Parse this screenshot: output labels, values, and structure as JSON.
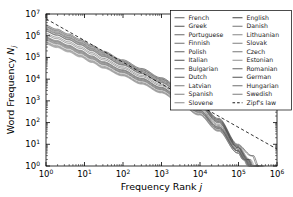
{
  "chart_data": {
    "type": "line",
    "title": "",
    "xlabel": "Frequency Rank j",
    "ylabel": "Word Frequency N_j",
    "xlabel_base": "Frequency Rank ",
    "xlabel_italic": "j",
    "ylabel_base": "Word Frequency ",
    "ylabel_italic": "N",
    "ylabel_sub": "j",
    "xscale": "log",
    "yscale": "log",
    "xlim": [
      1,
      1000000
    ],
    "ylim": [
      1,
      10000000
    ],
    "grid": false,
    "legend_position": "upper right",
    "xticks": [
      {
        "value": 1,
        "mantissa": "10",
        "exponent": "0"
      },
      {
        "value": 10,
        "mantissa": "10",
        "exponent": "1"
      },
      {
        "value": 100,
        "mantissa": "10",
        "exponent": "2"
      },
      {
        "value": 1000,
        "mantissa": "10",
        "exponent": "3"
      },
      {
        "value": 10000,
        "mantissa": "10",
        "exponent": "4"
      },
      {
        "value": 100000,
        "mantissa": "10",
        "exponent": "5"
      },
      {
        "value": 1000000,
        "mantissa": "10",
        "exponent": "6"
      }
    ],
    "yticks": [
      {
        "value": 1,
        "mantissa": "10",
        "exponent": "0"
      },
      {
        "value": 10,
        "mantissa": "10",
        "exponent": "1"
      },
      {
        "value": 100,
        "mantissa": "10",
        "exponent": "2"
      },
      {
        "value": 1000,
        "mantissa": "10",
        "exponent": "3"
      },
      {
        "value": 10000,
        "mantissa": "10",
        "exponent": "4"
      },
      {
        "value": 100000,
        "mantissa": "10",
        "exponent": "5"
      },
      {
        "value": 1000000,
        "mantissa": "10",
        "exponent": "6"
      },
      {
        "value": 10000000,
        "mantissa": "10",
        "exponent": "7"
      }
    ],
    "reference_line": {
      "name": "Zipf's law",
      "style": "dashed",
      "color": "#000000",
      "slope": -1,
      "points": [
        [
          1,
          6000000
        ],
        [
          1000000,
          6
        ]
      ]
    },
    "series": [
      {
        "name": "French",
        "color": "#4a4a4a",
        "x": [
          1,
          2,
          4,
          8,
          16,
          32,
          100,
          316,
          1000,
          3160,
          10000,
          31600,
          100000,
          200000,
          260000
        ],
        "y": [
          2400000,
          1500000,
          900000,
          520000,
          280000,
          150000,
          62000,
          25000,
          9500,
          3100,
          800,
          130,
          8,
          2,
          1
        ]
      },
      {
        "name": "Greek",
        "color": "#3d3d3d",
        "x": [
          1,
          2,
          4,
          8,
          16,
          32,
          100,
          316,
          1000,
          3160,
          10000,
          31600,
          100000,
          180000,
          240000
        ],
        "y": [
          1700000,
          1100000,
          680000,
          400000,
          215000,
          115000,
          47000,
          19000,
          7300,
          2400,
          640,
          105,
          7,
          2,
          1
        ]
      },
      {
        "name": "Portuguese",
        "color": "#555555",
        "x": [
          1,
          2,
          4,
          8,
          16,
          32,
          100,
          316,
          1000,
          3160,
          10000,
          31600,
          100000,
          175000,
          230000
        ],
        "y": [
          1900000,
          1250000,
          760000,
          440000,
          235000,
          125000,
          51000,
          21000,
          7900,
          2600,
          690,
          112,
          7,
          2,
          1
        ]
      },
      {
        "name": "Finnish",
        "color": "#606060",
        "x": [
          1,
          2,
          4,
          8,
          16,
          32,
          100,
          316,
          1000,
          3160,
          10000,
          31600,
          100000,
          160000,
          210000
        ],
        "y": [
          900000,
          600000,
          370000,
          215000,
          118000,
          64000,
          27000,
          11000,
          4200,
          1400,
          380,
          64,
          5,
          2,
          1
        ]
      },
      {
        "name": "Polish",
        "color": "#4f4f4f",
        "x": [
          1,
          2,
          4,
          8,
          16,
          32,
          100,
          316,
          1000,
          3160,
          10000,
          31600,
          100000,
          165000,
          220000
        ],
        "y": [
          1100000,
          730000,
          450000,
          262000,
          143000,
          77000,
          32000,
          13000,
          5000,
          1650,
          440,
          74,
          6,
          2,
          1
        ]
      },
      {
        "name": "Italian",
        "color": "#3a3a3a",
        "x": [
          1,
          2,
          4,
          8,
          16,
          32,
          100,
          316,
          1000,
          3160,
          10000,
          31600,
          100000,
          190000,
          250000
        ],
        "y": [
          2100000,
          1350000,
          820000,
          475000,
          255000,
          136000,
          56000,
          22500,
          8600,
          2850,
          740,
          120,
          8,
          2,
          1
        ]
      },
      {
        "name": "Bulgarian",
        "color": "#5a5a5a",
        "x": [
          1,
          2,
          4,
          8,
          16,
          32,
          100,
          316,
          1000,
          3160,
          10000,
          31600,
          100000,
          150000,
          200000
        ],
        "y": [
          700000,
          470000,
          290000,
          170000,
          94000,
          51000,
          22000,
          9000,
          3500,
          1180,
          320,
          55,
          5,
          2,
          1
        ]
      },
      {
        "name": "Dutch",
        "color": "#464646",
        "x": [
          1,
          2,
          4,
          8,
          16,
          32,
          100,
          316,
          1000,
          3160,
          10000,
          31600,
          100000,
          185000,
          245000
        ],
        "y": [
          1600000,
          1050000,
          640000,
          372000,
          200000,
          107000,
          44000,
          17800,
          6800,
          2250,
          600,
          98,
          7,
          2,
          1
        ]
      },
      {
        "name": "Latvian",
        "color": "#6b6b6b",
        "x": [
          1,
          2,
          4,
          8,
          16,
          32,
          100,
          316,
          1000,
          3160,
          10000,
          31600,
          100000,
          145000,
          190000
        ],
        "y": [
          520000,
          350000,
          218000,
          128000,
          71000,
          39000,
          17000,
          7000,
          2750,
          940,
          260,
          46,
          4,
          2,
          1
        ]
      },
      {
        "name": "Spanish",
        "color": "#737373",
        "x": [
          1,
          2,
          4,
          8,
          16,
          32,
          100,
          316,
          1000,
          3160,
          10000,
          31600,
          100000,
          210000,
          290000
        ],
        "y": [
          2800000,
          1800000,
          1080000,
          620000,
          330000,
          175000,
          71000,
          28500,
          10800,
          3550,
          910,
          146,
          9,
          2,
          1
        ]
      },
      {
        "name": "Slovene",
        "color": "#7d7d7d",
        "x": [
          1,
          2,
          4,
          8,
          16,
          32,
          100,
          316,
          1000,
          3160,
          10000,
          31600,
          100000,
          140000,
          185000
        ],
        "y": [
          450000,
          305000,
          190000,
          112000,
          62000,
          34000,
          15000,
          6200,
          2450,
          840,
          235,
          42,
          4,
          2,
          1
        ]
      },
      {
        "name": "English",
        "color": "#2e2e2e",
        "x": [
          1,
          2,
          4,
          8,
          16,
          32,
          100,
          316,
          1000,
          3160,
          10000,
          31600,
          100000,
          250000,
          350000
        ],
        "y": [
          3100000,
          2000000,
          1200000,
          690000,
          365000,
          193000,
          78000,
          31000,
          11700,
          3850,
          980,
          157,
          10,
          3,
          1
        ]
      },
      {
        "name": "Danish",
        "color": "#656565",
        "x": [
          1,
          2,
          4,
          8,
          16,
          32,
          100,
          316,
          1000,
          3160,
          10000,
          31600,
          100000,
          155000,
          205000
        ],
        "y": [
          800000,
          535000,
          330000,
          193000,
          106000,
          58000,
          25000,
          10200,
          3950,
          1330,
          360,
          61,
          5,
          2,
          1
        ]
      },
      {
        "name": "Lithuanian",
        "color": "#787878",
        "x": [
          1,
          2,
          4,
          8,
          16,
          32,
          100,
          316,
          1000,
          3160,
          10000,
          31600,
          100000,
          142000,
          188000
        ],
        "y": [
          480000,
          325000,
          203000,
          119000,
          66000,
          36000,
          15800,
          6550,
          2580,
          885,
          245,
          44,
          4,
          2,
          1
        ]
      },
      {
        "name": "Slovak",
        "color": "#707070",
        "x": [
          1,
          2,
          4,
          8,
          16,
          32,
          100,
          316,
          1000,
          3160,
          10000,
          31600,
          100000,
          148000,
          196000
        ],
        "y": [
          600000,
          405000,
          252000,
          148000,
          82000,
          45000,
          19500,
          8000,
          3120,
          1060,
          292,
          51,
          5,
          2,
          1
        ]
      },
      {
        "name": "Czech",
        "color": "#686868",
        "x": [
          1,
          2,
          4,
          8,
          16,
          32,
          100,
          316,
          1000,
          3160,
          10000,
          31600,
          100000,
          158000,
          208000
        ],
        "y": [
          760000,
          510000,
          315000,
          184000,
          101000,
          55000,
          23500,
          9650,
          3750,
          1265,
          345,
          59,
          5,
          2,
          1
        ]
      },
      {
        "name": "Estonian",
        "color": "#828282",
        "x": [
          1,
          2,
          4,
          8,
          16,
          32,
          100,
          316,
          1000,
          3160,
          10000,
          31600,
          100000,
          138000,
          180000
        ],
        "y": [
          420000,
          285000,
          178000,
          105000,
          58500,
          32000,
          14200,
          5900,
          2330,
          800,
          225,
          40,
          4,
          2,
          1
        ]
      },
      {
        "name": "Romanian",
        "color": "#525252",
        "x": [
          1,
          2,
          4,
          8,
          16,
          32,
          100,
          316,
          1000,
          3160,
          10000,
          31600,
          100000,
          172000,
          228000
        ],
        "y": [
          1300000,
          860000,
          528000,
          307000,
          167000,
          90000,
          37000,
          15000,
          5750,
          1900,
          505,
          84,
          6,
          2,
          1
        ]
      },
      {
        "name": "German",
        "color": "#3f3f3f",
        "x": [
          1,
          2,
          4,
          8,
          16,
          32,
          100,
          316,
          1000,
          3160,
          10000,
          31600,
          100000,
          230000,
          320000
        ],
        "y": [
          2600000,
          1680000,
          1010000,
          585000,
          312000,
          165000,
          67000,
          26800,
          10200,
          3350,
          860,
          138,
          9,
          3,
          1
        ]
      },
      {
        "name": "Hungarian",
        "color": "#5e5e5e",
        "x": [
          1,
          2,
          4,
          8,
          16,
          32,
          100,
          316,
          1000,
          3160,
          10000,
          31600,
          100000,
          152000,
          202000
        ],
        "y": [
          650000,
          440000,
          272000,
          159000,
          88000,
          48000,
          20800,
          8500,
          3320,
          1120,
          306,
          53,
          5,
          2,
          1
        ]
      },
      {
        "name": "Swedish",
        "color": "#6e6e6e",
        "x": [
          1,
          2,
          4,
          8,
          16,
          32,
          100,
          316,
          1000,
          3160,
          10000,
          31600,
          100000,
          162000,
          214000
        ],
        "y": [
          850000,
          570000,
          352000,
          206000,
          113000,
          61500,
          26500,
          10800,
          4200,
          1410,
          382,
          65,
          5,
          2,
          1
        ]
      }
    ]
  },
  "legend": {
    "columns": [
      {
        "entries": [
          {
            "label": "French",
            "style": "solid"
          },
          {
            "label": "Greek",
            "style": "solid"
          },
          {
            "label": "Portuguese",
            "style": "solid"
          },
          {
            "label": "Finnish",
            "style": "solid"
          },
          {
            "label": "Polish",
            "style": "solid"
          },
          {
            "label": "Italian",
            "style": "solid"
          },
          {
            "label": "Bulgarian",
            "style": "solid"
          },
          {
            "label": "Dutch",
            "style": "solid"
          },
          {
            "label": "Latvian",
            "style": "solid"
          },
          {
            "label": "Spanish",
            "style": "solid"
          },
          {
            "label": "Slovene",
            "style": "solid"
          }
        ]
      },
      {
        "entries": [
          {
            "label": "English",
            "style": "solid"
          },
          {
            "label": "Danish",
            "style": "solid"
          },
          {
            "label": "Lithuanian",
            "style": "solid"
          },
          {
            "label": "Slovak",
            "style": "solid"
          },
          {
            "label": "Czech",
            "style": "solid"
          },
          {
            "label": "Estonian",
            "style": "solid"
          },
          {
            "label": "Romanian",
            "style": "solid"
          },
          {
            "label": "German",
            "style": "solid"
          },
          {
            "label": "Hungarian",
            "style": "solid"
          },
          {
            "label": "Swedish",
            "style": "solid"
          },
          {
            "label": "Zipf's law",
            "style": "dashed"
          }
        ]
      }
    ]
  }
}
